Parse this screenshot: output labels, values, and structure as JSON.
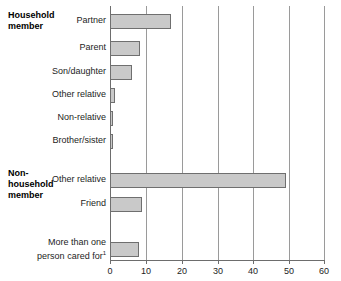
{
  "chart_data": {
    "type": "bar",
    "orientation": "horizontal",
    "title": "",
    "xlabel": "",
    "ylabel": "",
    "xlim": [
      0,
      60
    ],
    "xticks": [
      "0",
      "10",
      "20",
      "30",
      "40",
      "50",
      "60"
    ],
    "grid": true,
    "legend": "none",
    "groups": [
      {
        "name": "Household member",
        "label_lines": [
          "Household",
          "member"
        ],
        "categories": [
          "Partner",
          "Parent",
          "Son/daughter",
          "Other relative",
          "Non-relative",
          "Brother/sister"
        ],
        "values": [
          17,
          8.5,
          6,
          1.3,
          0.8,
          0.8
        ]
      },
      {
        "name": "Non-household member",
        "label_lines": [
          "Non-",
          "household",
          "member"
        ],
        "categories": [
          "Other relative",
          "Friend"
        ],
        "values": [
          49,
          9
        ]
      },
      {
        "name": "",
        "label_lines": [],
        "categories": [
          "More than one person cared for"
        ],
        "values": [
          8
        ]
      }
    ],
    "bar_color": "#c9c9c9",
    "bar_border_color": "#6f6f6f",
    "gridline_color": "#9a9a9a",
    "axis_color": "#6d6d6d",
    "footnote_marker": "1"
  },
  "labels": {
    "group_household_line1": "Household",
    "group_household_line2": "member",
    "group_nonhousehold_line1": "Non-",
    "group_nonhousehold_line2": "household",
    "group_nonhousehold_line3": "member",
    "cat_partner": "Partner",
    "cat_parent": "Parent",
    "cat_son_daughter": "Son/daughter",
    "cat_other_relative_hh": "Other relative",
    "cat_non_relative": "Non-relative",
    "cat_brother_sister": "Brother/sister",
    "cat_other_relative_nhh": "Other relative",
    "cat_friend": "Friend",
    "cat_more_than_one_line1": "More than one",
    "cat_more_than_one_line2": "person cared for",
    "footnote_sup": "1"
  },
  "ticks": {
    "t0": "0",
    "t1": "10",
    "t2": "20",
    "t3": "30",
    "t4": "40",
    "t5": "50",
    "t6": "60"
  }
}
